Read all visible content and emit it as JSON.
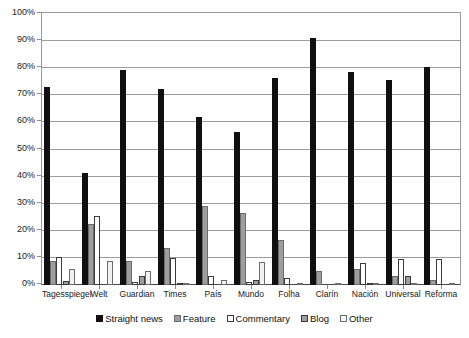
{
  "chart_data": {
    "type": "bar",
    "title": "",
    "subtitle": "",
    "xlabel": "",
    "ylabel": "",
    "ylim": [
      0,
      100
    ],
    "ytick_labels": [
      "0%",
      "10%",
      "20%",
      "30%",
      "40%",
      "50%",
      "60%",
      "70%",
      "80%",
      "90%",
      "100%"
    ],
    "ytick_values": [
      0,
      10,
      20,
      30,
      40,
      50,
      60,
      70,
      80,
      90,
      100
    ],
    "grid": "horizontal",
    "legend_position": "bottom",
    "categories": [
      "Tagesspiegel",
      "Welt",
      "Guardian",
      "Times",
      "País",
      "Mundo",
      "Folha",
      "Clarín",
      "Nación",
      "Universal",
      "Reforma"
    ],
    "series": [
      {
        "name": "Straight news",
        "color": "#101010",
        "values": [
          73,
          41.5,
          79.5,
          72.5,
          62,
          56.5,
          76.5,
          91,
          78.5,
          75.5,
          80.5
        ]
      },
      {
        "name": "Feature",
        "color": "#9e9e9e",
        "values": [
          9,
          22.5,
          9,
          13.5,
          29,
          26.5,
          16.5,
          5,
          6,
          3.5,
          2
        ]
      },
      {
        "name": "Commentary",
        "color": "#ffffff",
        "values": [
          10.5,
          25.5,
          1,
          10,
          3.5,
          1,
          2.5,
          0,
          8,
          9.5,
          9.5
        ]
      },
      {
        "name": "Blog",
        "color": "#9e9e9e",
        "values": [
          1.5,
          0,
          3.5,
          0.5,
          0,
          2,
          0,
          0,
          0.5,
          3.5,
          0
        ]
      },
      {
        "name": "Other",
        "color": "#f2f2f2",
        "values": [
          6,
          9,
          5,
          0.5,
          2,
          8.5,
          0.5,
          0.5,
          0.5,
          0.5,
          0.5
        ]
      }
    ]
  },
  "legend": {
    "items": [
      {
        "label": "Straight news"
      },
      {
        "label": "Feature"
      },
      {
        "label": "Commentary"
      },
      {
        "label": "Blog"
      },
      {
        "label": "Other"
      }
    ]
  }
}
